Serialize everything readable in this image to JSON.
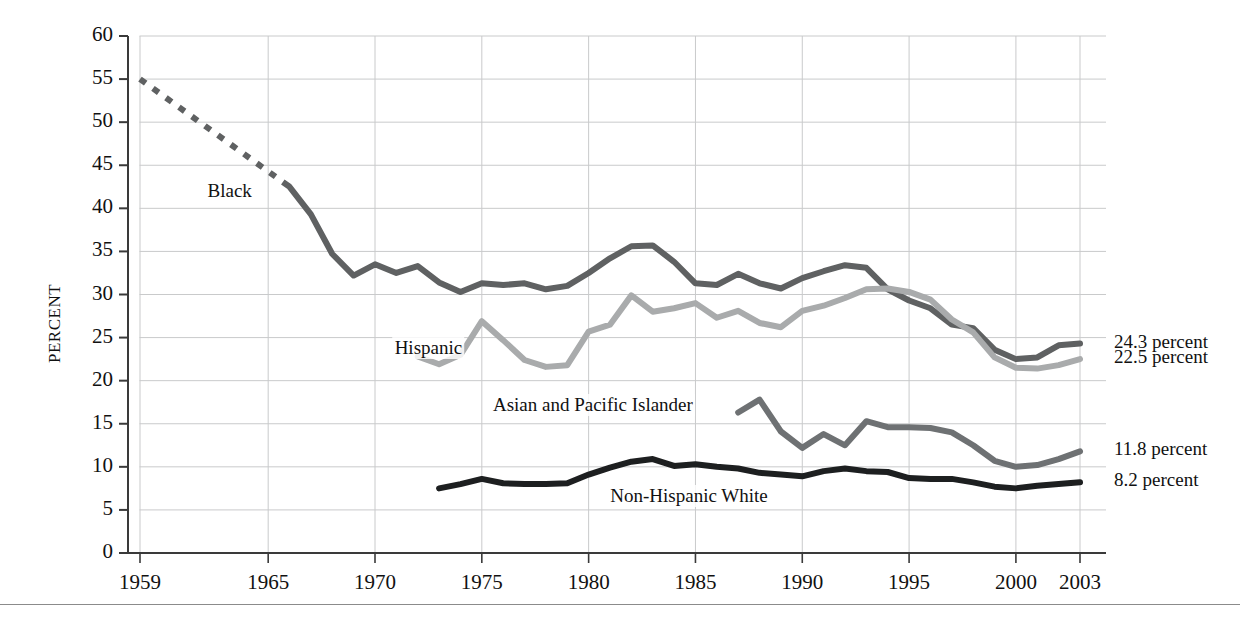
{
  "chart_data": {
    "type": "line",
    "title": "",
    "xlabel": "",
    "ylabel": "PERCENT",
    "xlim": [
      1959,
      2003
    ],
    "ylim": [
      0,
      60
    ],
    "ytick_step": 5,
    "grid": true,
    "legend": "inline-labels",
    "x_ticks": [
      "1959",
      "1965",
      "1970",
      "1975",
      "1980",
      "1985",
      "1990",
      "1995",
      "2000",
      "2003"
    ],
    "x_tick_values": [
      1959,
      1965,
      1970,
      1975,
      1980,
      1985,
      1990,
      1995,
      2000,
      2003
    ],
    "y_ticks": [
      "0",
      "5",
      "10",
      "15",
      "20",
      "25",
      "30",
      "35",
      "40",
      "45",
      "50",
      "55",
      "60"
    ],
    "y_tick_values": [
      0,
      5,
      10,
      15,
      20,
      25,
      30,
      35,
      40,
      45,
      50,
      55,
      60
    ],
    "series": [
      {
        "name": "Black",
        "color": "#5f6162",
        "label": "Black",
        "label_x": 1963.2,
        "label_y": 41.8,
        "end_label": "24.3 percent",
        "dashed_segment": {
          "from": 1959,
          "to": 1966
        },
        "x": [
          1959,
          1966,
          1967,
          1968,
          1969,
          1970,
          1971,
          1972,
          1973,
          1974,
          1975,
          1976,
          1977,
          1978,
          1979,
          1980,
          1981,
          1982,
          1983,
          1984,
          1985,
          1986,
          1987,
          1988,
          1989,
          1990,
          1991,
          1992,
          1993,
          1994,
          1995,
          1996,
          1997,
          1998,
          1999,
          2000,
          2001,
          2002,
          2003
        ],
        "y": [
          55.0,
          42.5,
          39.3,
          34.7,
          32.2,
          33.5,
          32.5,
          33.3,
          31.4,
          30.3,
          31.3,
          31.1,
          31.3,
          30.6,
          31.0,
          32.5,
          34.2,
          35.6,
          35.7,
          33.8,
          31.3,
          31.1,
          32.4,
          31.3,
          30.7,
          31.9,
          32.7,
          33.4,
          33.1,
          30.6,
          29.3,
          28.4,
          26.5,
          26.1,
          23.6,
          22.5,
          22.7,
          24.1,
          24.3
        ]
      },
      {
        "name": "Hispanic",
        "color": "#a9abac",
        "label": "Hispanic",
        "label_x": 1972.5,
        "label_y": 23.6,
        "end_label": "22.5 percent",
        "x": [
          1972,
          1973,
          1974,
          1975,
          1976,
          1977,
          1978,
          1979,
          1980,
          1981,
          1982,
          1983,
          1984,
          1985,
          1986,
          1987,
          1988,
          1989,
          1990,
          1991,
          1992,
          1993,
          1994,
          1995,
          1996,
          1997,
          1998,
          1999,
          2000,
          2001,
          2002,
          2003
        ],
        "y": [
          22.8,
          21.9,
          23.0,
          26.9,
          24.7,
          22.4,
          21.6,
          21.8,
          25.7,
          26.5,
          29.9,
          28.0,
          28.4,
          29.0,
          27.3,
          28.1,
          26.7,
          26.2,
          28.1,
          28.7,
          29.6,
          30.6,
          30.7,
          30.3,
          29.4,
          27.1,
          25.6,
          22.7,
          21.5,
          21.4,
          21.8,
          22.5
        ]
      },
      {
        "name": "Asian and Pacific Islander",
        "color": "#6e7173",
        "label": "Asian and Pacific Islander",
        "label_x": 1980.2,
        "label_y": 17.0,
        "end_label": "11.8 percent",
        "x": [
          1987,
          1988,
          1989,
          1990,
          1991,
          1992,
          1993,
          1994,
          1995,
          1996,
          1997,
          1998,
          1999,
          2000,
          2001,
          2002,
          2003
        ],
        "y": [
          16.3,
          17.8,
          14.1,
          12.2,
          13.8,
          12.5,
          15.3,
          14.6,
          14.6,
          14.5,
          14.0,
          12.5,
          10.7,
          10.0,
          10.2,
          10.9,
          11.8
        ]
      },
      {
        "name": "Non-Hispanic White",
        "color": "#1d1f20",
        "label": "Non-Hispanic White",
        "label_x": 1984.7,
        "label_y": 6.4,
        "end_label": "8.2 percent",
        "x": [
          1973,
          1974,
          1975,
          1976,
          1977,
          1978,
          1979,
          1980,
          1981,
          1982,
          1983,
          1984,
          1985,
          1986,
          1987,
          1988,
          1989,
          1990,
          1991,
          1992,
          1993,
          1994,
          1995,
          1996,
          1997,
          1998,
          1999,
          2000,
          2001,
          2002,
          2003
        ],
        "y": [
          7.5,
          8.0,
          8.6,
          8.1,
          8.0,
          8.0,
          8.1,
          9.1,
          9.9,
          10.6,
          10.9,
          10.1,
          10.3,
          10.0,
          9.8,
          9.3,
          9.1,
          8.9,
          9.5,
          9.8,
          9.5,
          9.4,
          8.7,
          8.6,
          8.6,
          8.2,
          7.7,
          7.5,
          7.8,
          8.0,
          8.2
        ]
      }
    ]
  }
}
